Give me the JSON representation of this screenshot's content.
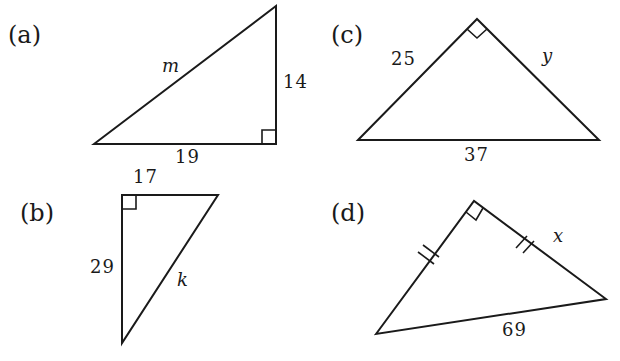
{
  "figure": {
    "triangles": [
      {
        "id": "a",
        "label": "(a)",
        "sides": {
          "hypotenuse": "m",
          "vertical_leg": "14",
          "horizontal_leg": "19"
        },
        "right_angle": "bottom-right"
      },
      {
        "id": "b",
        "label": "(b)",
        "sides": {
          "top_leg": "17",
          "vertical_leg": "29",
          "hypotenuse": "k"
        },
        "right_angle": "top-left"
      },
      {
        "id": "c",
        "label": "(c)",
        "sides": {
          "left_leg": "25",
          "right_leg": "y",
          "hypotenuse": "37"
        },
        "right_angle": "apex"
      },
      {
        "id": "d",
        "label": "(d)",
        "sides": {
          "left_leg": "congruent-to-x",
          "right_leg": "x",
          "hypotenuse": "69"
        },
        "right_angle": "apex",
        "congruence_marks": "double tick on both legs"
      }
    ]
  }
}
